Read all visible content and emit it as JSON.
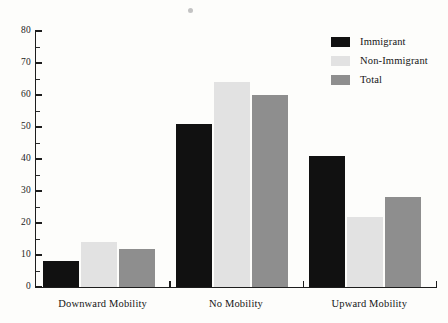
{
  "chart_data": {
    "type": "bar",
    "title": "",
    "subtitle": "",
    "xlabel": "",
    "ylabel": "",
    "categories": [
      "Downward Mobility",
      "No Mobility",
      "Upward Mobility"
    ],
    "series": [
      {
        "name": "Immigrant",
        "color": "#111111",
        "values": [
          8,
          51,
          41
        ]
      },
      {
        "name": "Non-Immigrant",
        "color": "#e2e2e2",
        "values": [
          14,
          64,
          22
        ]
      },
      {
        "name": "Total",
        "color": "#8e8e8e",
        "values": [
          12,
          60,
          28
        ]
      }
    ],
    "ylim": [
      0,
      80
    ],
    "y_major_ticks": [
      0,
      10,
      20,
      30,
      40,
      50,
      60,
      70,
      80
    ],
    "y_tick_labels": [
      "0",
      "10",
      "20",
      "30",
      "40",
      "50",
      "60",
      "70",
      "80"
    ],
    "y_minor_ticks": [
      5,
      15,
      25,
      35,
      45,
      55,
      65,
      75
    ],
    "grid": false,
    "legend_position": "top-right"
  },
  "legend": {
    "entries": [
      {
        "label": "Immigrant"
      },
      {
        "label": "Non-Immigrant"
      },
      {
        "label": "Total"
      }
    ]
  },
  "axes": {
    "y_tick_labels": [
      "80",
      "70",
      "60",
      "50",
      "40",
      "30",
      "20",
      "10",
      "0"
    ],
    "x_tick_labels": [
      "Downward Mobility",
      "No Mobility",
      "Upward Mobility"
    ]
  }
}
